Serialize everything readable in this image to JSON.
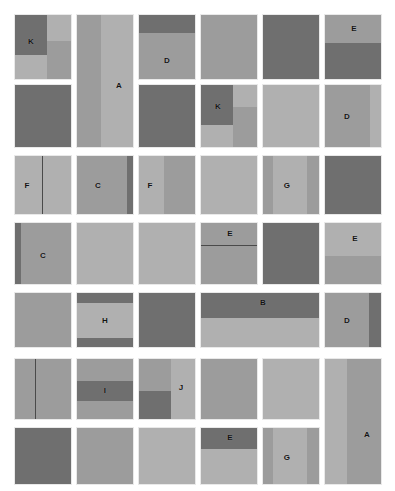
{
  "canvas": {
    "width": 395,
    "height": 491,
    "background": "#ffffff"
  },
  "palette": {
    "dark": "#6f6f6f",
    "mid": "#868686",
    "light": "#9c9c9c",
    "pale": "#b0b0b0",
    "divider": "#4a4a4a",
    "tile_border": "#e9e9e9",
    "label_color": "#131313"
  },
  "legend": {
    "letters": [
      "A",
      "B",
      "C",
      "D",
      "E",
      "F",
      "G",
      "H",
      "I",
      "J",
      "K"
    ]
  },
  "grid": {
    "columns": 6,
    "rows": 7,
    "col_x": [
      14,
      76,
      138,
      200,
      262,
      324
    ],
    "col_w": 58,
    "row_y": [
      14,
      84,
      155,
      222,
      292,
      358,
      427
    ],
    "row_h": [
      66,
      64,
      60,
      63,
      56,
      62,
      58
    ]
  },
  "tiles": [
    {
      "id": "t-r1c1",
      "label": "K",
      "label_x": 16,
      "label_y": 27,
      "x": 14,
      "y": 14,
      "w": 58,
      "h": 66,
      "parts": [
        {
          "x": 0,
          "y": 0,
          "w": 32,
          "h": 40,
          "fill": "dark"
        },
        {
          "x": 32,
          "y": 0,
          "w": 26,
          "h": 26,
          "fill": "pale"
        },
        {
          "x": 32,
          "y": 26,
          "w": 26,
          "h": 40,
          "fill": "light"
        },
        {
          "x": 0,
          "y": 40,
          "w": 32,
          "h": 26,
          "fill": "pale"
        }
      ]
    },
    {
      "id": "t-r2c1",
      "label": "",
      "label_x": 0,
      "label_y": 0,
      "x": 14,
      "y": 84,
      "w": 58,
      "h": 64,
      "parts": [
        {
          "x": 0,
          "y": 0,
          "w": 58,
          "h": 64,
          "fill": "dark"
        }
      ]
    },
    {
      "id": "t-r1r2c2",
      "label": "A",
      "label_x": 42,
      "label_y": 71,
      "x": 76,
      "y": 14,
      "w": 58,
      "h": 134,
      "parts": [
        {
          "x": 0,
          "y": 0,
          "w": 24,
          "h": 134,
          "fill": "light"
        },
        {
          "x": 24,
          "y": 0,
          "w": 34,
          "h": 134,
          "fill": "pale"
        }
      ]
    },
    {
      "id": "t-r1c3",
      "label": "D",
      "label_x": 28,
      "label_y": 46,
      "x": 138,
      "y": 14,
      "w": 58,
      "h": 66,
      "parts": [
        {
          "x": 0,
          "y": 0,
          "w": 58,
          "h": 18,
          "fill": "dark"
        },
        {
          "x": 0,
          "y": 18,
          "w": 58,
          "h": 48,
          "fill": "light"
        }
      ]
    },
    {
      "id": "t-r2c3",
      "label": "",
      "label_x": 0,
      "label_y": 0,
      "x": 138,
      "y": 84,
      "w": 58,
      "h": 64,
      "parts": [
        {
          "x": 0,
          "y": 0,
          "w": 58,
          "h": 64,
          "fill": "dark"
        }
      ]
    },
    {
      "id": "t-r1c4",
      "label": "",
      "label_x": 0,
      "label_y": 0,
      "x": 200,
      "y": 14,
      "w": 58,
      "h": 66,
      "parts": [
        {
          "x": 0,
          "y": 0,
          "w": 58,
          "h": 66,
          "fill": "light"
        }
      ]
    },
    {
      "id": "t-r2c4",
      "label": "K",
      "label_x": 17,
      "label_y": 22,
      "x": 200,
      "y": 84,
      "w": 58,
      "h": 64,
      "parts": [
        {
          "x": 0,
          "y": 0,
          "w": 32,
          "h": 40,
          "fill": "dark"
        },
        {
          "x": 32,
          "y": 0,
          "w": 26,
          "h": 22,
          "fill": "pale"
        },
        {
          "x": 32,
          "y": 22,
          "w": 26,
          "h": 42,
          "fill": "light"
        },
        {
          "x": 0,
          "y": 40,
          "w": 32,
          "h": 24,
          "fill": "pale"
        }
      ]
    },
    {
      "id": "t-r1c5",
      "label": "",
      "label_x": 0,
      "label_y": 0,
      "x": 262,
      "y": 14,
      "w": 58,
      "h": 66,
      "parts": [
        {
          "x": 0,
          "y": 0,
          "w": 58,
          "h": 66,
          "fill": "dark"
        }
      ]
    },
    {
      "id": "t-r2c5",
      "label": "",
      "label_x": 0,
      "label_y": 0,
      "x": 262,
      "y": 84,
      "w": 58,
      "h": 64,
      "parts": [
        {
          "x": 0,
          "y": 0,
          "w": 58,
          "h": 64,
          "fill": "pale"
        }
      ]
    },
    {
      "id": "t-r1c6",
      "label": "E",
      "label_x": 29,
      "label_y": 14,
      "x": 324,
      "y": 14,
      "w": 58,
      "h": 66,
      "parts": [
        {
          "x": 0,
          "y": 0,
          "w": 58,
          "h": 28,
          "fill": "light"
        },
        {
          "x": 0,
          "y": 28,
          "w": 58,
          "h": 38,
          "fill": "dark"
        }
      ]
    },
    {
      "id": "t-r2c6",
      "label": "D",
      "label_x": 22,
      "label_y": 32,
      "x": 324,
      "y": 84,
      "w": 58,
      "h": 64,
      "parts": [
        {
          "x": 0,
          "y": 0,
          "w": 45,
          "h": 64,
          "fill": "light"
        },
        {
          "x": 45,
          "y": 0,
          "w": 13,
          "h": 64,
          "fill": "pale"
        }
      ]
    },
    {
      "id": "t-r3c1",
      "label": "F",
      "label_x": 12,
      "label_y": 30,
      "x": 14,
      "y": 155,
      "w": 58,
      "h": 60,
      "parts": [
        {
          "x": 0,
          "y": 0,
          "w": 27,
          "h": 60,
          "fill": "pale"
        },
        {
          "x": 27,
          "y": 0,
          "w": 31,
          "h": 60,
          "fill": "pale"
        }
      ],
      "lines": [
        {
          "x": 27,
          "y": 0,
          "w": 1,
          "h": 60
        }
      ]
    },
    {
      "id": "t-r3c2",
      "label": "C",
      "label_x": 21,
      "label_y": 30,
      "x": 76,
      "y": 155,
      "w": 58,
      "h": 60,
      "parts": [
        {
          "x": 0,
          "y": 0,
          "w": 50,
          "h": 60,
          "fill": "light"
        },
        {
          "x": 50,
          "y": 0,
          "w": 8,
          "h": 60,
          "fill": "dark"
        }
      ]
    },
    {
      "id": "t-r3c3",
      "label": "F",
      "label_x": 11,
      "label_y": 30,
      "x": 138,
      "y": 155,
      "w": 58,
      "h": 60,
      "parts": [
        {
          "x": 0,
          "y": 0,
          "w": 25,
          "h": 60,
          "fill": "pale"
        },
        {
          "x": 25,
          "y": 0,
          "w": 33,
          "h": 60,
          "fill": "light"
        }
      ]
    },
    {
      "id": "t-r3c4",
      "label": "",
      "label_x": 0,
      "label_y": 0,
      "x": 200,
      "y": 155,
      "w": 58,
      "h": 60,
      "parts": [
        {
          "x": 0,
          "y": 0,
          "w": 58,
          "h": 60,
          "fill": "pale"
        }
      ]
    },
    {
      "id": "t-r3c5",
      "label": "G",
      "label_x": 24,
      "label_y": 30,
      "x": 262,
      "y": 155,
      "w": 58,
      "h": 60,
      "parts": [
        {
          "x": 0,
          "y": 0,
          "w": 10,
          "h": 60,
          "fill": "light"
        },
        {
          "x": 10,
          "y": 0,
          "w": 34,
          "h": 60,
          "fill": "pale"
        },
        {
          "x": 44,
          "y": 0,
          "w": 14,
          "h": 60,
          "fill": "light"
        }
      ]
    },
    {
      "id": "t-r3c6",
      "label": "",
      "label_x": 0,
      "label_y": 0,
      "x": 324,
      "y": 155,
      "w": 58,
      "h": 60,
      "parts": [
        {
          "x": 0,
          "y": 0,
          "w": 58,
          "h": 60,
          "fill": "dark"
        }
      ]
    },
    {
      "id": "t-r4c1",
      "label": "C",
      "label_x": 28,
      "label_y": 33,
      "x": 14,
      "y": 222,
      "w": 58,
      "h": 63,
      "parts": [
        {
          "x": 0,
          "y": 0,
          "w": 6,
          "h": 63,
          "fill": "dark"
        },
        {
          "x": 6,
          "y": 0,
          "w": 52,
          "h": 63,
          "fill": "light"
        }
      ]
    },
    {
      "id": "t-r4c2",
      "label": "",
      "label_x": 0,
      "label_y": 0,
      "x": 76,
      "y": 222,
      "w": 58,
      "h": 63,
      "parts": [
        {
          "x": 0,
          "y": 0,
          "w": 58,
          "h": 63,
          "fill": "pale"
        }
      ]
    },
    {
      "id": "t-r4c3",
      "label": "",
      "label_x": 0,
      "label_y": 0,
      "x": 138,
      "y": 222,
      "w": 58,
      "h": 63,
      "parts": [
        {
          "x": 0,
          "y": 0,
          "w": 58,
          "h": 63,
          "fill": "pale"
        }
      ]
    },
    {
      "id": "t-r4c4",
      "label": "E",
      "label_x": 29,
      "label_y": 11,
      "x": 200,
      "y": 222,
      "w": 58,
      "h": 63,
      "parts": [
        {
          "x": 0,
          "y": 0,
          "w": 58,
          "h": 22,
          "fill": "light"
        },
        {
          "x": 0,
          "y": 22,
          "w": 58,
          "h": 41,
          "fill": "light"
        }
      ],
      "lines": [
        {
          "x": 0,
          "y": 22,
          "w": 58,
          "h": 1
        }
      ]
    },
    {
      "id": "t-r4c5",
      "label": "",
      "label_x": 0,
      "label_y": 0,
      "x": 262,
      "y": 222,
      "w": 58,
      "h": 63,
      "parts": [
        {
          "x": 0,
          "y": 0,
          "w": 58,
          "h": 63,
          "fill": "dark"
        }
      ]
    },
    {
      "id": "t-r4c6",
      "label": "E",
      "label_x": 30,
      "label_y": 16,
      "x": 324,
      "y": 222,
      "w": 58,
      "h": 63,
      "parts": [
        {
          "x": 0,
          "y": 0,
          "w": 58,
          "h": 33,
          "fill": "pale"
        },
        {
          "x": 0,
          "y": 33,
          "w": 58,
          "h": 30,
          "fill": "light"
        }
      ]
    },
    {
      "id": "t-r5c1",
      "label": "",
      "label_x": 0,
      "label_y": 0,
      "x": 14,
      "y": 292,
      "w": 58,
      "h": 56,
      "parts": [
        {
          "x": 0,
          "y": 0,
          "w": 58,
          "h": 56,
          "fill": "light"
        }
      ]
    },
    {
      "id": "t-r5c2",
      "label": "H",
      "label_x": 28,
      "label_y": 28,
      "x": 76,
      "y": 292,
      "w": 58,
      "h": 56,
      "parts": [
        {
          "x": 0,
          "y": 0,
          "w": 58,
          "h": 10,
          "fill": "dark"
        },
        {
          "x": 0,
          "y": 10,
          "w": 58,
          "h": 35,
          "fill": "pale"
        },
        {
          "x": 0,
          "y": 45,
          "w": 58,
          "h": 11,
          "fill": "dark"
        }
      ]
    },
    {
      "id": "t-r5c3",
      "label": "",
      "label_x": 0,
      "label_y": 0,
      "x": 138,
      "y": 292,
      "w": 58,
      "h": 56,
      "parts": [
        {
          "x": 0,
          "y": 0,
          "w": 58,
          "h": 56,
          "fill": "dark"
        }
      ]
    },
    {
      "id": "t-r5c4c5",
      "label": "B",
      "label_x": 62,
      "label_y": 10,
      "x": 200,
      "y": 292,
      "w": 120,
      "h": 56,
      "parts": [
        {
          "x": 0,
          "y": 0,
          "w": 120,
          "h": 25,
          "fill": "dark"
        },
        {
          "x": 0,
          "y": 25,
          "w": 120,
          "h": 31,
          "fill": "pale"
        }
      ]
    },
    {
      "id": "t-r5c6",
      "label": "D",
      "label_x": 22,
      "label_y": 28,
      "x": 324,
      "y": 292,
      "w": 58,
      "h": 56,
      "parts": [
        {
          "x": 0,
          "y": 0,
          "w": 44,
          "h": 56,
          "fill": "light"
        },
        {
          "x": 44,
          "y": 0,
          "w": 14,
          "h": 56,
          "fill": "dark"
        }
      ]
    },
    {
      "id": "t-r6c1",
      "label": "",
      "label_x": 0,
      "label_y": 0,
      "x": 14,
      "y": 358,
      "w": 58,
      "h": 62,
      "parts": [
        {
          "x": 0,
          "y": 0,
          "w": 20,
          "h": 62,
          "fill": "light"
        },
        {
          "x": 20,
          "y": 0,
          "w": 38,
          "h": 62,
          "fill": "light"
        }
      ],
      "lines": [
        {
          "x": 20,
          "y": 0,
          "w": 1,
          "h": 62
        }
      ]
    },
    {
      "id": "t-r6c2",
      "label": "I",
      "label_x": 28,
      "label_y": 32,
      "x": 76,
      "y": 358,
      "w": 58,
      "h": 62,
      "parts": [
        {
          "x": 0,
          "y": 0,
          "w": 58,
          "h": 22,
          "fill": "light"
        },
        {
          "x": 0,
          "y": 22,
          "w": 58,
          "h": 20,
          "fill": "dark"
        },
        {
          "x": 0,
          "y": 42,
          "w": 58,
          "h": 20,
          "fill": "light"
        }
      ]
    },
    {
      "id": "t-r6c3",
      "label": "J",
      "label_x": 42,
      "label_y": 29,
      "x": 138,
      "y": 358,
      "w": 58,
      "h": 62,
      "parts": [
        {
          "x": 0,
          "y": 0,
          "w": 32,
          "h": 32,
          "fill": "light"
        },
        {
          "x": 0,
          "y": 32,
          "w": 32,
          "h": 30,
          "fill": "dark"
        },
        {
          "x": 32,
          "y": 0,
          "w": 26,
          "h": 62,
          "fill": "pale"
        }
      ]
    },
    {
      "id": "t-r6c4",
      "label": "",
      "label_x": 0,
      "label_y": 0,
      "x": 200,
      "y": 358,
      "w": 58,
      "h": 62,
      "parts": [
        {
          "x": 0,
          "y": 0,
          "w": 58,
          "h": 62,
          "fill": "light"
        }
      ]
    },
    {
      "id": "t-r6c5",
      "label": "",
      "label_x": 0,
      "label_y": 0,
      "x": 262,
      "y": 358,
      "w": 58,
      "h": 62,
      "parts": [
        {
          "x": 0,
          "y": 0,
          "w": 58,
          "h": 62,
          "fill": "pale"
        }
      ]
    },
    {
      "id": "t-r6r7c6",
      "label": "A",
      "label_x": 42,
      "label_y": 76,
      "x": 324,
      "y": 358,
      "w": 58,
      "h": 127,
      "parts": [
        {
          "x": 0,
          "y": 0,
          "w": 22,
          "h": 127,
          "fill": "pale"
        },
        {
          "x": 22,
          "y": 0,
          "w": 36,
          "h": 127,
          "fill": "light"
        }
      ]
    },
    {
      "id": "t-r7c1",
      "label": "",
      "label_x": 0,
      "label_y": 0,
      "x": 14,
      "y": 427,
      "w": 58,
      "h": 58,
      "parts": [
        {
          "x": 0,
          "y": 0,
          "w": 58,
          "h": 58,
          "fill": "dark"
        }
      ]
    },
    {
      "id": "t-r7c2",
      "label": "",
      "label_x": 0,
      "label_y": 0,
      "x": 76,
      "y": 427,
      "w": 58,
      "h": 58,
      "parts": [
        {
          "x": 0,
          "y": 0,
          "w": 58,
          "h": 58,
          "fill": "light"
        }
      ]
    },
    {
      "id": "t-r7c3",
      "label": "",
      "label_x": 0,
      "label_y": 0,
      "x": 138,
      "y": 427,
      "w": 58,
      "h": 58,
      "parts": [
        {
          "x": 0,
          "y": 0,
          "w": 58,
          "h": 58,
          "fill": "pale"
        }
      ]
    },
    {
      "id": "t-r7c4",
      "label": "E",
      "label_x": 29,
      "label_y": 10,
      "x": 200,
      "y": 427,
      "w": 58,
      "h": 58,
      "parts": [
        {
          "x": 0,
          "y": 0,
          "w": 58,
          "h": 21,
          "fill": "dark"
        },
        {
          "x": 0,
          "y": 21,
          "w": 58,
          "h": 37,
          "fill": "pale"
        }
      ]
    },
    {
      "id": "t-r7c5",
      "label": "G",
      "label_x": 24,
      "label_y": 30,
      "x": 262,
      "y": 427,
      "w": 58,
      "h": 58,
      "parts": [
        {
          "x": 0,
          "y": 0,
          "w": 10,
          "h": 58,
          "fill": "light"
        },
        {
          "x": 10,
          "y": 0,
          "w": 34,
          "h": 58,
          "fill": "pale"
        },
        {
          "x": 44,
          "y": 0,
          "w": 14,
          "h": 58,
          "fill": "light"
        }
      ]
    }
  ]
}
